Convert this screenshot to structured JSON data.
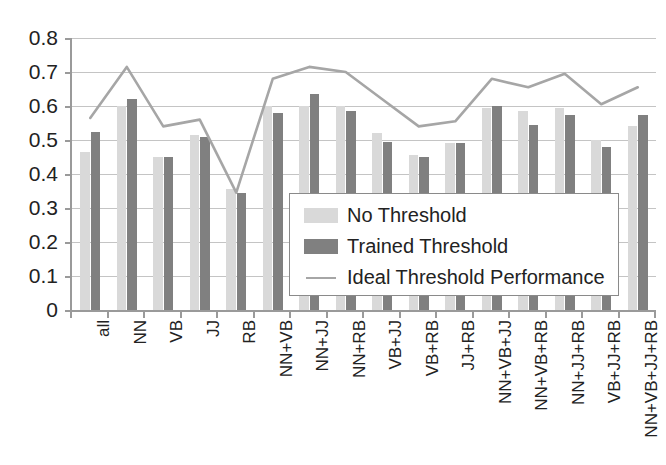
{
  "chart_data": {
    "type": "bar",
    "title": "",
    "xlabel": "",
    "ylabel": "",
    "ylim": [
      0,
      0.8
    ],
    "grid": true,
    "legend_position": "inside-lower-right",
    "categories": [
      "all",
      "NN",
      "VB",
      "JJ",
      "RB",
      "NN+VB",
      "NN+JJ",
      "NN+RB",
      "VB+JJ",
      "VB+RB",
      "JJ+RB",
      "NN+VB+JJ",
      "NN+VB+RB",
      "NN+JJ+RB",
      "VB+JJ+RB",
      "NN+VB+JJ+RB"
    ],
    "ytick_labels": [
      "0.8",
      "0.7",
      "0.6",
      "0.5",
      "0.4",
      "0.3",
      "0.2",
      "0.1",
      "0"
    ],
    "ytick_values": [
      0.8,
      0.7,
      0.6,
      0.5,
      0.4,
      0.3,
      0.2,
      0.1,
      0
    ],
    "series": [
      {
        "name": "No Threshold",
        "type": "bar",
        "color": "#d9d9d9",
        "values": [
          0.465,
          0.6,
          0.45,
          0.515,
          0.355,
          0.6,
          0.6,
          0.6,
          0.52,
          0.455,
          0.49,
          0.595,
          0.585,
          0.595,
          0.5,
          0.54
        ]
      },
      {
        "name": "Trained Threshold",
        "type": "bar",
        "color": "#808080",
        "values": [
          0.525,
          0.62,
          0.45,
          0.51,
          0.345,
          0.58,
          0.635,
          0.585,
          0.495,
          0.45,
          0.49,
          0.6,
          0.545,
          0.575,
          0.48,
          0.575
        ]
      },
      {
        "name": "Ideal Threshold Performance",
        "type": "line",
        "color": "#a6a6a6",
        "values": [
          0.565,
          0.715,
          0.54,
          0.56,
          0.345,
          0.68,
          0.715,
          0.7,
          0.62,
          0.54,
          0.555,
          0.68,
          0.655,
          0.695,
          0.605,
          0.655
        ]
      }
    ]
  },
  "legend": {
    "items": [
      {
        "label": "No Threshold",
        "swatch": "light"
      },
      {
        "label": "Trained Threshold",
        "swatch": "dark"
      },
      {
        "label": "Ideal Threshold Performance",
        "swatch": "line"
      }
    ]
  }
}
